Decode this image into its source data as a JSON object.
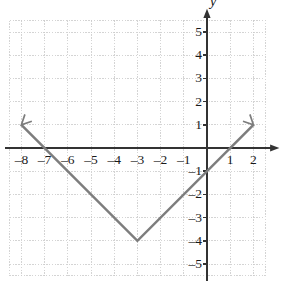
{
  "figure": {
    "axis_x_name": "x",
    "axis_y_name": "y",
    "line_color": "#7d7d7d",
    "axis_color": "#333333",
    "grid_color": "#c9c9c9",
    "label_color": "#1a1a1a"
  },
  "chart_data": {
    "type": "line",
    "title": "",
    "xlabel": "x",
    "ylabel": "y",
    "equation": "y = |x + 3| - 4",
    "xlim": [
      -8.5,
      2.5
    ],
    "ylim": [
      -5.5,
      5.5
    ],
    "grid": true,
    "legend": "none",
    "x_ticks": [
      -8,
      -7,
      -6,
      -5,
      -4,
      -3,
      -2,
      -1,
      1,
      2
    ],
    "x_tick_labels": [
      "–8",
      "–7",
      "–6",
      "–5",
      "–4",
      "–3",
      "–2",
      "–1",
      "1",
      "2"
    ],
    "y_ticks": [
      5,
      4,
      3,
      2,
      1,
      -1,
      -2,
      -3,
      -4,
      -5
    ],
    "y_tick_labels": [
      "5",
      "4",
      "3",
      "2",
      "1",
      "–1",
      "–2",
      "–3",
      "–4",
      "–5"
    ],
    "series": [
      {
        "name": "y = |x + 3| - 4",
        "points": [
          [
            -8.0,
            1.0
          ],
          [
            -3.0,
            -4.0
          ],
          [
            2.0,
            1.0
          ]
        ],
        "vertex": [
          -3,
          -4
        ],
        "x_intercepts": [
          -7,
          1
        ],
        "y_intercept": -1,
        "arrow_start": true,
        "arrow_end": true
      }
    ]
  }
}
